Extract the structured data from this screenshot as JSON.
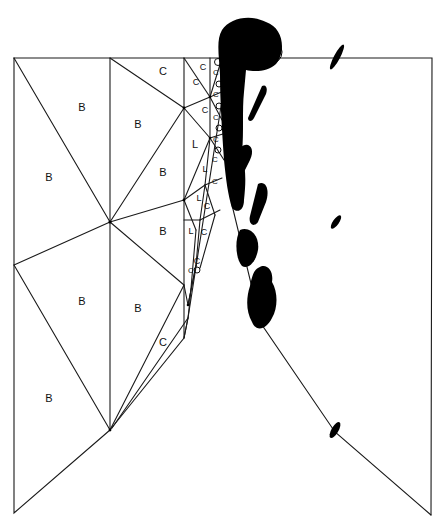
{
  "diagram": {
    "type": "finite-element-mesh",
    "colors": {
      "line": "#1a1a1a",
      "blob": "#000000",
      "background": "#ffffff"
    },
    "labels": [
      {
        "text": "C",
        "x": 163,
        "y": 72,
        "size": 11
      },
      {
        "text": "B",
        "x": 82,
        "y": 108,
        "size": 11
      },
      {
        "text": "B",
        "x": 138,
        "y": 125,
        "size": 11
      },
      {
        "text": "B",
        "x": 49,
        "y": 178,
        "size": 11
      },
      {
        "text": "B",
        "x": 163,
        "y": 173,
        "size": 11
      },
      {
        "text": "L",
        "x": 195,
        "y": 145,
        "size": 11
      },
      {
        "text": "B",
        "x": 163,
        "y": 232,
        "size": 11
      },
      {
        "text": "B",
        "x": 82,
        "y": 302,
        "size": 11
      },
      {
        "text": "B",
        "x": 138,
        "y": 309,
        "size": 11
      },
      {
        "text": "C",
        "x": 163,
        "y": 343,
        "size": 11
      },
      {
        "text": "B",
        "x": 49,
        "y": 399,
        "size": 11
      },
      {
        "text": "C",
        "x": 203,
        "y": 68,
        "size": 9
      },
      {
        "text": "C",
        "x": 196,
        "y": 83,
        "size": 9
      },
      {
        "text": "C",
        "x": 205,
        "y": 111,
        "size": 9
      },
      {
        "text": "C",
        "x": 216,
        "y": 73,
        "size": 8
      },
      {
        "text": "C",
        "x": 216,
        "y": 95,
        "size": 8
      },
      {
        "text": "C",
        "x": 216,
        "y": 118,
        "size": 8
      },
      {
        "text": "C",
        "x": 216,
        "y": 140,
        "size": 8
      },
      {
        "text": "L",
        "x": 205,
        "y": 170,
        "size": 9
      },
      {
        "text": "C",
        "x": 215,
        "y": 160,
        "size": 8
      },
      {
        "text": "C",
        "x": 207,
        "y": 207,
        "size": 9
      },
      {
        "text": "L",
        "x": 199,
        "y": 199,
        "size": 9
      },
      {
        "text": "L",
        "x": 191,
        "y": 232,
        "size": 9
      },
      {
        "text": "C",
        "x": 204,
        "y": 233,
        "size": 9
      },
      {
        "text": "C",
        "x": 197,
        "y": 262,
        "size": 9
      },
      {
        "text": "C",
        "x": 191,
        "y": 271,
        "size": 8
      },
      {
        "text": "C",
        "x": 215,
        "y": 182,
        "size": 8
      }
    ]
  }
}
